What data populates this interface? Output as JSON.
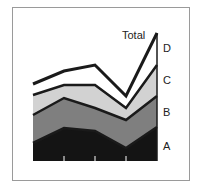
{
  "chart_data": {
    "type": "area",
    "stacked": true,
    "title": "",
    "xlabel": "",
    "ylabel": "",
    "categories": [
      "1",
      "2",
      "3",
      "4",
      "5"
    ],
    "series": [
      {
        "name": "A",
        "values": [
          18,
          33,
          30,
          13,
          34
        ],
        "color": "#141414"
      },
      {
        "name": "B",
        "values": [
          28,
          30,
          23,
          28,
          31
        ],
        "color": "#7f7f7f"
      },
      {
        "name": "C",
        "values": [
          20,
          13,
          23,
          12,
          31
        ],
        "color": "#d2d2d2"
      },
      {
        "name": "D",
        "values": [
          11,
          14,
          20,
          12,
          32
        ],
        "color": "#ffffff"
      }
    ],
    "total": [
      77,
      90,
      96,
      65,
      128
    ],
    "total_label": "Total",
    "legend_position": "right, inline labels",
    "grid": false,
    "axis_ticks": "x-axis tick marks only, no labels",
    "ylim": [
      0,
      128
    ]
  },
  "labels": {
    "total": "Total",
    "A": "A",
    "B": "B",
    "C": "C",
    "D": "D"
  },
  "colors": {
    "line": "#1a1a1a",
    "frame": "#9a9a9a"
  }
}
